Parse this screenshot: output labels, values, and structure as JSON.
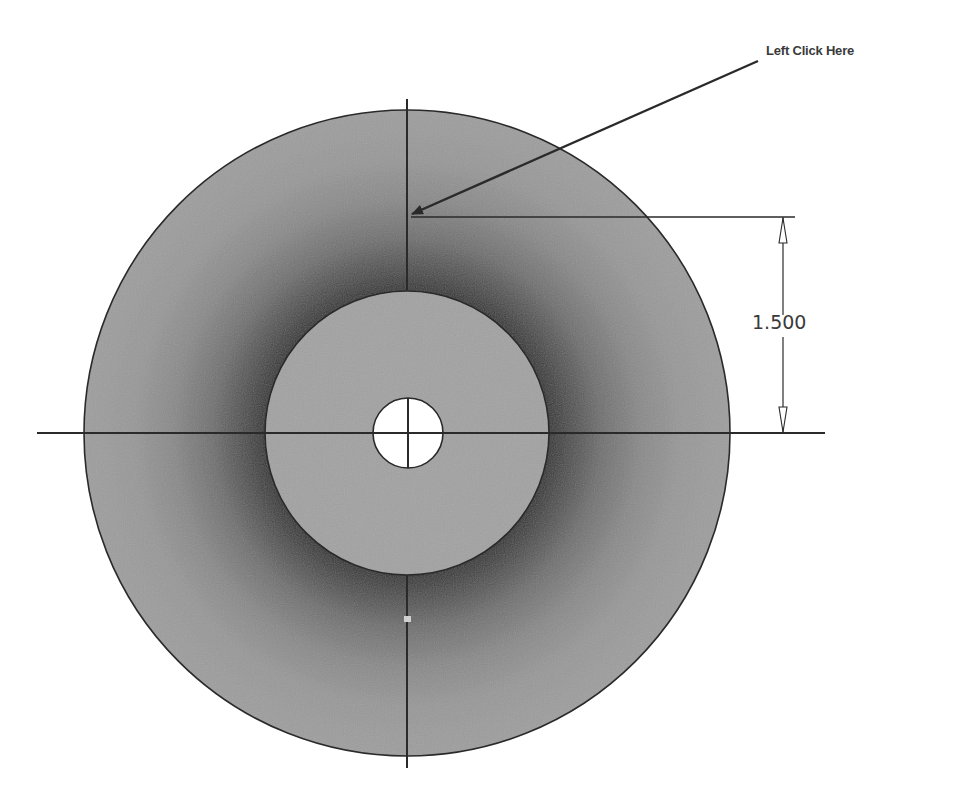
{
  "callout": {
    "label": "Left Click Here",
    "arrow_from": [
      758,
      60
    ],
    "arrow_to": [
      410,
      215
    ]
  },
  "dimension": {
    "value": "1.500",
    "type": "vertical-linear",
    "from_y": 217,
    "to_y": 433,
    "x": 783
  },
  "geometry": {
    "center": [
      407,
      433
    ],
    "outer_circle_radius": 323,
    "inner_circle_radius": 142,
    "hole_radius": 35
  },
  "colors": {
    "background": "#ffffff",
    "outer_fill": "#9a9a9a",
    "outer_shadow": "#3c3c3c",
    "inner_fill": "#a2a2a2",
    "hole_fill": "#ffffff",
    "line": "#2a2a2a",
    "text": "#3a3a3a",
    "grip_point": "#d0d0d0"
  }
}
